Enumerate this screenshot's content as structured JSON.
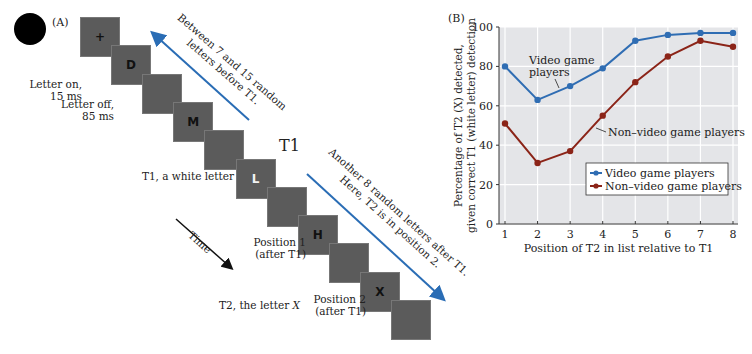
{
  "panel_a": {
    "label": "(A)",
    "stimuli": [
      {
        "letter": "+",
        "white": false
      },
      {
        "letter": "D",
        "white": false
      },
      {
        "letter": "",
        "white": false
      },
      {
        "letter": "M",
        "white": false
      },
      {
        "letter": "",
        "white": false
      },
      {
        "letter": "L",
        "white": true
      },
      {
        "letter": "",
        "white": false
      },
      {
        "letter": "H",
        "white": false
      },
      {
        "letter": "",
        "white": false
      },
      {
        "letter": "X",
        "white": false
      },
      {
        "letter": "",
        "white": false
      }
    ],
    "notes": {
      "letter_on": [
        "Letter on,",
        "15 ms"
      ],
      "letter_off": [
        "Letter off,",
        "85 ms"
      ],
      "t1_desc": "T1, a white letter",
      "position1": [
        "Position 1",
        "(after T1)"
      ],
      "position2": [
        "Position 2",
        "(after T1)"
      ],
      "t2_desc_prefix": "T2, the letter ",
      "t2_desc_letter": "X",
      "t1_label": "T1",
      "time_label": "Time"
    },
    "arrows": {
      "before": [
        "Between 7 and 15 random",
        "letters before T1."
      ],
      "after": [
        "Another 8 random letters after T1.",
        "Here, T2 is in position 2."
      ]
    },
    "colors": {
      "arrow": "#2a6db5",
      "box": "#5b5b5b"
    }
  },
  "panel_b": {
    "label": "(B)",
    "annotations": {
      "video": [
        "Video game",
        "players"
      ],
      "nonvideo": "Non–video game players"
    },
    "legend": [
      "Video game players",
      "Non–video game players"
    ]
  },
  "chart_data": {
    "type": "line",
    "title": "",
    "xlabel": "Position of T2 in list relative to T1",
    "ylabel": "Percentage of T2 (X) detected, given correct T1 (white letter) detection",
    "ylabel_lines": [
      "Percentage of T2 (X) detected,",
      "given correct T1 (white letter) detection"
    ],
    "x": [
      1,
      2,
      3,
      4,
      5,
      6,
      7,
      8
    ],
    "xticks": [
      "1",
      "2",
      "3",
      "4",
      "5",
      "6",
      "7",
      "8"
    ],
    "yticks": [
      "0",
      "20",
      "40",
      "60",
      "80",
      "100"
    ],
    "ylim": [
      0,
      100
    ],
    "grid": true,
    "legend_position": "lower right",
    "series": [
      {
        "name": "Video game players",
        "color": "#2f6db3",
        "values": [
          80,
          63,
          70,
          79,
          93,
          96,
          97,
          97
        ]
      },
      {
        "name": "Non–video game players",
        "color": "#8b2418",
        "values": [
          51,
          31,
          37,
          55,
          72,
          85,
          93,
          90
        ]
      }
    ]
  }
}
